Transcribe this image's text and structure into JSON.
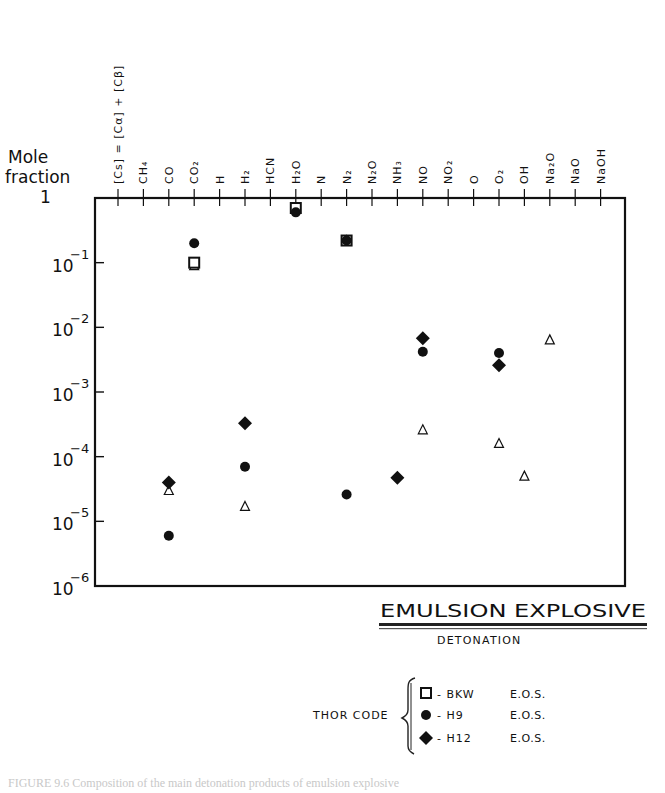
{
  "chart_data": {
    "type": "scatter",
    "title": "EMULSION EXPLOSIVE",
    "subtitle": "DETONATION",
    "ylabel": "Mole fraction",
    "yscale": "log",
    "ylim": [
      1e-06,
      1
    ],
    "ytick_labels": [
      "1",
      "10^-1",
      "10^-2",
      "10^-3",
      "10^-4",
      "10^-5",
      "10^-6"
    ],
    "yticks": [
      1,
      0.1,
      0.01,
      0.001,
      0.0001,
      1e-05,
      1e-06
    ],
    "categories": [
      "[Cs] = [Cα] + [Cβ]",
      "CH4",
      "CO",
      "CO2",
      "H",
      "H2",
      "HCN",
      "H2O",
      "N",
      "N2",
      "N2O",
      "NH3",
      "NO",
      "NO2",
      "O",
      "O2",
      "OH",
      "Na2O",
      "NaO",
      "NaOH"
    ],
    "category_labels_html": [
      "[Cs] = [Cα] + [Cβ]",
      "CH₄",
      "CO",
      "CO₂",
      "H",
      "H₂",
      "HCN",
      "H₂O",
      "N",
      "N₂",
      "N₂O",
      "NH₃",
      "NO",
      "NO₂",
      "O",
      "O₂",
      "OH",
      "Na₂O",
      "NaO",
      "NaOH"
    ],
    "grid": false,
    "series": [
      {
        "name": "BKW E.O.S.",
        "marker": "open-square",
        "points": [
          {
            "x": "CO2",
            "y": 0.1
          },
          {
            "x": "H2O",
            "y": 0.7
          },
          {
            "x": "N2",
            "y": 0.22
          }
        ]
      },
      {
        "name": "H9 E.O.S.",
        "marker": "filled-circle",
        "points": [
          {
            "x": "CO",
            "y": 6e-06
          },
          {
            "x": "CO2",
            "y": 0.2
          },
          {
            "x": "H2",
            "y": 7e-05
          },
          {
            "x": "H2O",
            "y": 0.6
          },
          {
            "x": "N2",
            "y": 0.22
          },
          {
            "x": "N2",
            "y": 2.6e-05
          },
          {
            "x": "NO",
            "y": 0.0042
          },
          {
            "x": "O2",
            "y": 0.004
          }
        ]
      },
      {
        "name": "H12 E.O.S.",
        "marker": "filled-diamond",
        "points": [
          {
            "x": "CO",
            "y": 4e-05
          },
          {
            "x": "H2",
            "y": 0.00033
          },
          {
            "x": "NH3",
            "y": 4.7e-05
          },
          {
            "x": "NO",
            "y": 0.0068
          },
          {
            "x": "O2",
            "y": 0.0026
          }
        ]
      },
      {
        "name": "unlabeled (open triangle)",
        "marker": "open-triangle",
        "points": [
          {
            "x": "CO",
            "y": 3e-05
          },
          {
            "x": "CO2",
            "y": 0.09
          },
          {
            "x": "H2",
            "y": 1.7e-05
          },
          {
            "x": "H2O",
            "y": 0.7
          },
          {
            "x": "N2",
            "y": 0.22
          },
          {
            "x": "NO",
            "y": 0.00026
          },
          {
            "x": "O2",
            "y": 0.00016
          },
          {
            "x": "OH",
            "y": 5e-05
          },
          {
            "x": "Na2O",
            "y": 0.0064
          }
        ]
      }
    ],
    "legend": {
      "group_label": "THOR CODE",
      "position": "bottom-right, below plot",
      "entries": [
        {
          "marker": "open-square",
          "label": "- BKW",
          "suffix": "E.O.S."
        },
        {
          "marker": "filled-circle",
          "label": "- H9",
          "suffix": "E.O.S."
        },
        {
          "marker": "filled-diamond",
          "label": "- H12",
          "suffix": "E.O.S."
        }
      ]
    }
  },
  "axis": {
    "ylabel_line1": "Mole",
    "ylabel_line2": "fraction"
  },
  "annotation": {
    "title": "EMULSION  EXPLOSIVE",
    "subtitle": "DETONATION"
  },
  "legend": {
    "group_label": "THOR CODE",
    "entries": [
      {
        "name": "- BKW",
        "eos": "E.O.S."
      },
      {
        "name": "- H9",
        "eos": "E.O.S."
      },
      {
        "name": "- H12",
        "eos": "E.O.S."
      }
    ]
  },
  "caption": {
    "text": "FIGURE 9.6   Composition of the main detonation products of emulsion explosive"
  },
  "colors": {
    "ink": "#111111",
    "background": "#ffffff"
  }
}
